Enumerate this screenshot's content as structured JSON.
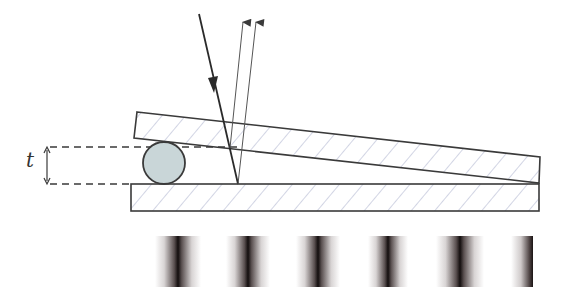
{
  "diagram": {
    "labels": {
      "thickness": "t"
    },
    "colors": {
      "line": "#3a3a3a",
      "hatch": "#9aa0c8",
      "sphere_fill": "#c9d6d8",
      "fringe_dark": "#151010",
      "background": "#ffffff"
    },
    "elements": {
      "top_plate": "tilted glass plate",
      "bottom_plate": "flat glass plate",
      "spacer": "sphere / wire of thickness t",
      "incident_ray": "incoming light ray",
      "reflected_rays": 2,
      "fringes": 6
    },
    "fringe_centers_x": [
      178,
      247,
      318,
      388,
      460,
      528
    ]
  }
}
